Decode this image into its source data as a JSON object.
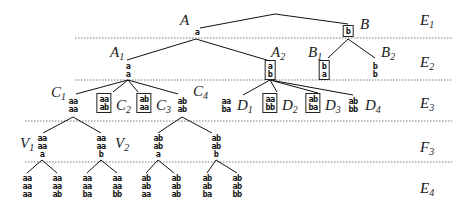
{
  "levels": [
    {
      "label": "E",
      "sub": "1",
      "y": 20
    },
    {
      "label": "E",
      "sub": "2",
      "y": 55
    },
    {
      "label": "E",
      "sub": "3",
      "y": 103
    },
    {
      "label": "F",
      "sub": "3",
      "y": 145
    },
    {
      "label": "E",
      "sub": "4",
      "y": 188
    }
  ],
  "dividers_y": [
    38,
    80,
    121,
    162
  ],
  "nodes": {
    "A": {
      "label": "A",
      "sub": "",
      "rows": [
        "a"
      ],
      "boxed": false
    },
    "B": {
      "label": "B",
      "sub": "",
      "rows": [
        "b"
      ],
      "boxed": true
    },
    "A1": {
      "label": "A",
      "sub": "1",
      "rows": [
        "a",
        "a"
      ],
      "boxed": false
    },
    "A2": {
      "label": "A",
      "sub": "2",
      "rows": [
        "a",
        "b"
      ],
      "boxed": true
    },
    "B1": {
      "label": "B",
      "sub": "1",
      "rows": [
        "b",
        "a"
      ],
      "boxed": true
    },
    "B2": {
      "label": "B",
      "sub": "2",
      "rows": [
        "b",
        "b"
      ],
      "boxed": false
    },
    "C1": {
      "label": "C",
      "sub": "1",
      "rows": [
        "aa",
        "aa"
      ],
      "boxed": false
    },
    "C2": {
      "label": "C",
      "sub": "2",
      "rows": [
        "aa",
        "ab"
      ],
      "boxed": true
    },
    "C3": {
      "label": "C",
      "sub": "3",
      "rows": [
        "ab",
        "aa"
      ],
      "boxed": true
    },
    "C4": {
      "label": "C",
      "sub": "4",
      "rows": [
        "ab",
        "ab"
      ],
      "boxed": false
    },
    "D1": {
      "label": "D",
      "sub": "1",
      "rows": [
        "aa",
        "ba"
      ],
      "boxed": false
    },
    "D2": {
      "label": "D",
      "sub": "2",
      "rows": [
        "aa",
        "bb"
      ],
      "boxed": true
    },
    "D3": {
      "label": "D",
      "sub": "3",
      "rows": [
        "ab",
        "ba"
      ],
      "boxed": true
    },
    "D4": {
      "label": "D",
      "sub": "4",
      "rows": [
        "ab",
        "bb"
      ],
      "boxed": false
    },
    "V1": {
      "label": "V",
      "sub": "1",
      "rows": [
        "aa",
        "aa",
        "a"
      ],
      "boxed": false
    },
    "V2": {
      "label": "V",
      "sub": "2",
      "rows": [
        "aa",
        "aa",
        "b"
      ],
      "boxed": false
    },
    "F3": {
      "label": "",
      "sub": "",
      "rows": [
        "ab",
        "ab",
        "a"
      ],
      "boxed": false
    },
    "F4": {
      "label": "",
      "sub": "",
      "rows": [
        "ab",
        "ab",
        "b"
      ],
      "boxed": false
    },
    "L1": {
      "rows": [
        "aa",
        "aa",
        "aa"
      ]
    },
    "L2": {
      "rows": [
        "aa",
        "aa",
        "ab"
      ]
    },
    "L3": {
      "rows": [
        "aa",
        "aa",
        "ba"
      ]
    },
    "L4": {
      "rows": [
        "aa",
        "aa",
        "bb"
      ]
    },
    "L5": {
      "rows": [
        "ab",
        "ab",
        "aa"
      ]
    },
    "L6": {
      "rows": [
        "ab",
        "ab",
        "ab"
      ]
    },
    "L7": {
      "rows": [
        "ab",
        "ab",
        "ba"
      ]
    },
    "L8": {
      "rows": [
        "ab",
        "ab",
        "bb"
      ]
    }
  },
  "edges": [
    [
      "root",
      "A"
    ],
    [
      "root",
      "B"
    ],
    [
      "A",
      "A1"
    ],
    [
      "A",
      "A2"
    ],
    [
      "B",
      "B1"
    ],
    [
      "B",
      "B2"
    ],
    [
      "A1",
      "C1"
    ],
    [
      "A1",
      "C2"
    ],
    [
      "A1",
      "C3"
    ],
    [
      "A1",
      "C4"
    ],
    [
      "A2",
      "D1"
    ],
    [
      "A2",
      "D2"
    ],
    [
      "A2",
      "D3"
    ],
    [
      "A2",
      "D4"
    ],
    [
      "C1",
      "V1"
    ],
    [
      "C1",
      "V2"
    ],
    [
      "C4",
      "F3"
    ],
    [
      "C4",
      "F4"
    ],
    [
      "V1",
      "L1"
    ],
    [
      "V1",
      "L2"
    ],
    [
      "V2",
      "L3"
    ],
    [
      "V2",
      "L4"
    ],
    [
      "F3",
      "L5"
    ],
    [
      "F3",
      "L6"
    ],
    [
      "F4",
      "L7"
    ],
    [
      "F4",
      "L8"
    ]
  ]
}
